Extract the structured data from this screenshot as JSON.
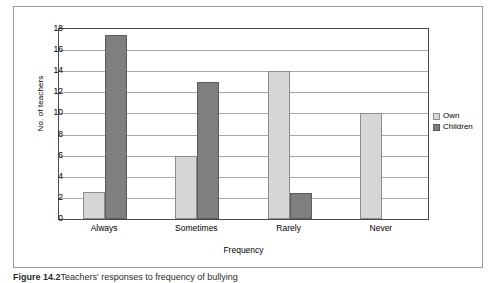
{
  "figure": {
    "caption_label": "Figure 14.2",
    "caption_text": "Teachers' responses to frequency of bullying"
  },
  "legend": {
    "position": "right",
    "entries": [
      {
        "label": "Own",
        "color": "#d6d6d6",
        "icon": "legend-swatch-icon"
      },
      {
        "label": "Children",
        "color": "#7f7f7f",
        "icon": "legend-swatch-icon"
      }
    ]
  },
  "chart_data": {
    "type": "bar",
    "title": "",
    "xlabel": "Frequency",
    "ylabel": "No. of teachers",
    "categories": [
      "Always",
      "Sometimes",
      "Rarely",
      "Never"
    ],
    "series": [
      {
        "name": "Own",
        "color": "#d6d6d6",
        "values": [
          2.6,
          6,
          14,
          10
        ]
      },
      {
        "name": "Children",
        "color": "#7f7f7f",
        "values": [
          17.4,
          13,
          2.5,
          0
        ]
      }
    ],
    "ylim": [
      0,
      18
    ],
    "ytick_step": 2,
    "yticks": [
      0,
      2,
      4,
      6,
      8,
      10,
      12,
      14,
      16,
      18
    ],
    "ytick_labels": [
      "0",
      "2",
      "4",
      "6",
      "8",
      "10",
      "12",
      "14",
      "16",
      "18"
    ],
    "grid": true,
    "grid_axis": "y",
    "legend_position": "right"
  }
}
